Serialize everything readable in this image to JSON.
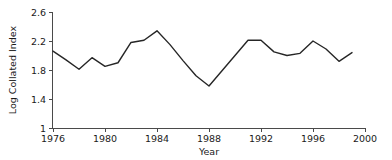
{
  "chart_data": {
    "type": "line",
    "title": "",
    "xlabel": "Year",
    "ylabel": "Log Collated Index",
    "xlim": [
      1976,
      2000
    ],
    "ylim": [
      1,
      2.6
    ],
    "grid": false,
    "legend": "none",
    "x_ticks": [
      1976,
      1980,
      1984,
      1988,
      1992,
      1996,
      2000
    ],
    "y_ticks": [
      1,
      1.4,
      1.8,
      2.2,
      2.6
    ],
    "x_tick_labels": [
      "1976",
      "1980",
      "1984",
      "1988",
      "1992",
      "1996",
      "2000"
    ],
    "y_tick_labels": [
      "1",
      "1.4",
      "1.8",
      "2.2",
      "2.6"
    ],
    "line_color": "#262626",
    "x": [
      1976,
      1977,
      1978,
      1979,
      1980,
      1981,
      1982,
      1983,
      1984,
      1985,
      1986,
      1987,
      1988,
      1989,
      1990,
      1991,
      1992,
      1993,
      1994,
      1995,
      1996,
      1997,
      1998,
      1999
    ],
    "values": [
      2.06,
      1.94,
      1.81,
      1.97,
      1.85,
      1.9,
      2.18,
      2.21,
      2.34,
      2.15,
      1.93,
      1.72,
      1.58,
      1.79,
      2.0,
      2.21,
      2.21,
      2.05,
      2.0,
      2.03,
      2.2,
      2.09,
      1.92,
      2.04
    ],
    "series": [
      {
        "name": "Log Collated Index",
        "values": [
          2.06,
          1.94,
          1.81,
          1.97,
          1.85,
          1.9,
          2.18,
          2.21,
          2.34,
          2.15,
          1.93,
          1.72,
          1.58,
          1.79,
          2.0,
          2.21,
          2.21,
          2.05,
          2.0,
          2.03,
          2.2,
          2.09,
          1.92,
          2.04
        ]
      }
    ]
  },
  "axes": {
    "x_title": "Year",
    "y_title": "Log Collated Index"
  }
}
